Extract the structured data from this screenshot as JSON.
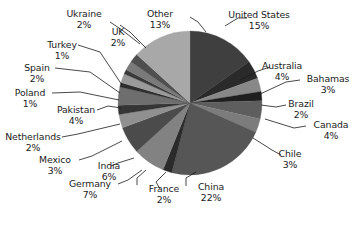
{
  "chart_data": {
    "type": "pie",
    "title": "",
    "categories": [
      "United States",
      "Australia",
      "Bahamas",
      "Brazil",
      "Canada",
      "Chile",
      "China",
      "France",
      "Germany",
      "India",
      "Mexico",
      "Netherlands",
      "Pakistan",
      "Poland",
      "Spain",
      "Turkey",
      "UK",
      "Ukraine",
      "Other"
    ],
    "values": [
      15,
      4,
      3,
      2,
      4,
      3,
      22,
      2,
      7,
      6,
      3,
      2,
      4,
      1,
      2,
      1,
      2,
      2,
      13
    ],
    "value_unit": "%",
    "start_angle_deg": 0,
    "direction": "clockwise",
    "legend": "none",
    "labels_position": "outside-with-leader-lines",
    "grid": false,
    "slice_colors": [
      "#3f3f3f",
      "#2a2a2a",
      "#888888",
      "#1f1f1f",
      "#5e5e5e",
      "#7c7c7c",
      "#565656",
      "#2b2b2b",
      "#828282",
      "#4b4b4b",
      "#909090",
      "#353535",
      "#6e6e6e",
      "#2e2e2e",
      "#9a9a9a",
      "#3a3a3a",
      "#7a7a7a",
      "#4f4f4f",
      "#a8a8a8"
    ],
    "slices": [
      {
        "label": "United States",
        "value": 15,
        "value_text": "15%",
        "color": "#3f3f3f"
      },
      {
        "label": "Australia",
        "value": 4,
        "value_text": "4%",
        "color": "#2a2a2a"
      },
      {
        "label": "Bahamas",
        "value": 3,
        "value_text": "3%",
        "color": "#888888"
      },
      {
        "label": "Brazil",
        "value": 2,
        "value_text": "2%",
        "color": "#1f1f1f"
      },
      {
        "label": "Canada",
        "value": 4,
        "value_text": "4%",
        "color": "#5e5e5e"
      },
      {
        "label": "Chile",
        "value": 3,
        "value_text": "3%",
        "color": "#7c7c7c"
      },
      {
        "label": "China",
        "value": 22,
        "value_text": "22%",
        "color": "#565656"
      },
      {
        "label": "France",
        "value": 2,
        "value_text": "2%",
        "color": "#2b2b2b"
      },
      {
        "label": "Germany",
        "value": 7,
        "value_text": "7%",
        "color": "#828282"
      },
      {
        "label": "India",
        "value": 6,
        "value_text": "6%",
        "color": "#4b4b4b"
      },
      {
        "label": "Mexico",
        "value": 3,
        "value_text": "3%",
        "color": "#909090"
      },
      {
        "label": "Netherlands",
        "value": 2,
        "value_text": "2%",
        "color": "#353535"
      },
      {
        "label": "Pakistan",
        "value": 4,
        "value_text": "4%",
        "color": "#6e6e6e"
      },
      {
        "label": "Poland",
        "value": 1,
        "value_text": "1%",
        "color": "#2e2e2e"
      },
      {
        "label": "Spain",
        "value": 2,
        "value_text": "2%",
        "color": "#9a9a9a"
      },
      {
        "label": "Turkey",
        "value": 1,
        "value_text": "1%",
        "color": "#3a3a3a"
      },
      {
        "label": "UK",
        "value": 2,
        "value_text": "2%",
        "color": "#7a7a7a"
      },
      {
        "label": "Ukraine",
        "value": 2,
        "value_text": "2%",
        "color": "#4f4f4f"
      },
      {
        "label": "Other",
        "value": 13,
        "value_text": "13%",
        "color": "#a8a8a8"
      }
    ],
    "geometry": {
      "cx": 190,
      "cy": 103,
      "r": 72
    }
  }
}
